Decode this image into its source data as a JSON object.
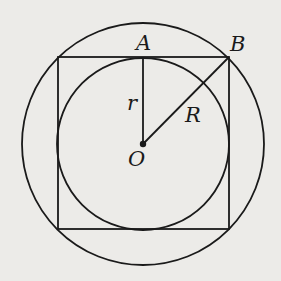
{
  "diagram": {
    "labels": {
      "A": "A",
      "B": "B",
      "r": "r",
      "R": "R",
      "O": "O"
    },
    "geometry": {
      "center": [
        143,
        144
      ],
      "outer_circle_radius": 121,
      "inner_circle_radius": 86,
      "square": {
        "left": 58,
        "top": 57,
        "right": 229,
        "bottom": 229
      },
      "point_A": [
        143,
        57
      ],
      "point_B": [
        229,
        57
      ]
    },
    "colors": {
      "stroke": "#1a1a1a",
      "background": "#ecebe8"
    }
  }
}
